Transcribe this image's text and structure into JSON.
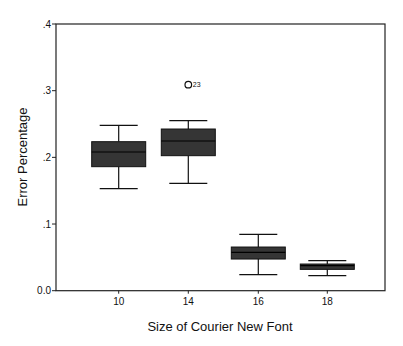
{
  "chart_data": {
    "type": "boxplot",
    "title": "",
    "xlabel": "Size of Courier New Font",
    "ylabel": "Error Percentage",
    "ylim": [
      0.0,
      0.4
    ],
    "yticks": [
      0.0,
      0.1,
      0.2,
      0.3,
      0.4
    ],
    "ytick_labels": [
      "0.0",
      ".1",
      ".2",
      ".3",
      ".4"
    ],
    "categories": [
      "10",
      "14",
      "16",
      "18"
    ],
    "grid": false,
    "legend": null,
    "series": [
      {
        "name": "Error Percentage",
        "boxes": [
          {
            "category": "10",
            "whisker_low": 0.153,
            "q1": 0.186,
            "median": 0.208,
            "q3": 0.2235,
            "whisker_high": 0.248,
            "outliers": []
          },
          {
            "category": "14",
            "whisker_low": 0.161,
            "q1": 0.2025,
            "median": 0.2245,
            "q3": 0.2425,
            "whisker_high": 0.255,
            "outliers": [
              {
                "value": 0.309,
                "label": "23"
              }
            ]
          },
          {
            "category": "16",
            "whisker_low": 0.024,
            "q1": 0.0475,
            "median": 0.0575,
            "q3": 0.0655,
            "whisker_high": 0.0845,
            "outliers": []
          },
          {
            "category": "18",
            "whisker_low": 0.0225,
            "q1": 0.032,
            "median": 0.0375,
            "q3": 0.04,
            "whisker_high": 0.045,
            "outliers": []
          }
        ]
      }
    ],
    "colors": {
      "box_fill": "#353535",
      "line": "#111111",
      "background": "#ffffff"
    }
  },
  "page": {
    "top_strip_text": " "
  }
}
